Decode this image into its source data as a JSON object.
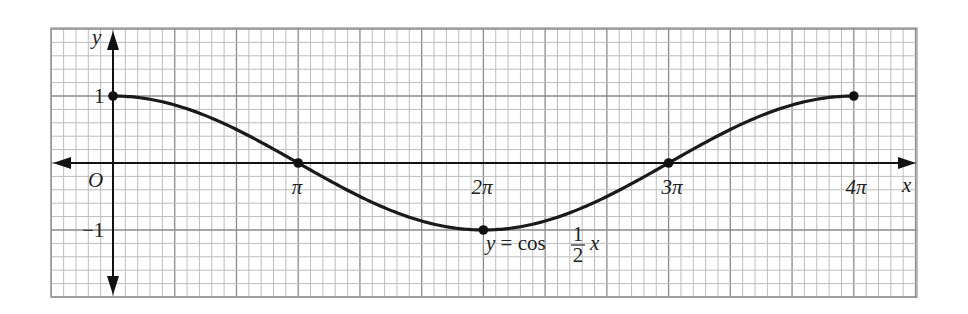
{
  "chart_data": {
    "type": "line",
    "title": "",
    "function_label": {
      "lhs": "y = cos",
      "frac_num": "1",
      "frac_den": "2",
      "var": "x"
    },
    "xlabel": "x",
    "ylabel": "y",
    "origin_label": "O",
    "x_ticks": [
      {
        "value": 3.14159,
        "label": "π"
      },
      {
        "value": 6.28319,
        "label": "2π"
      },
      {
        "value": 9.42478,
        "label": "3π"
      },
      {
        "value": 12.56637,
        "label": "4π"
      }
    ],
    "y_ticks": [
      {
        "value": 1,
        "label": "1"
      },
      {
        "value": -1,
        "label": "−1"
      }
    ],
    "xlim": [
      -1.0472,
      13.6136
    ],
    "ylim": [
      -2,
      2
    ],
    "grid": true,
    "series": [
      {
        "name": "y = cos(x/2)",
        "domain": [
          0,
          12.56637
        ],
        "color": "#1a1a1a"
      }
    ],
    "marked_points": [
      {
        "x": 0,
        "y": 1
      },
      {
        "x": 3.14159,
        "y": 0
      },
      {
        "x": 6.28319,
        "y": -1
      },
      {
        "x": 9.42478,
        "y": 0
      },
      {
        "x": 12.56637,
        "y": 1
      }
    ]
  }
}
